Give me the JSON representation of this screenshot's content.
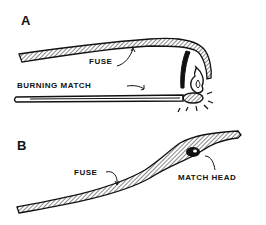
{
  "panels": [
    {
      "letter": "A",
      "labels": {
        "fuse": "FUSE",
        "burning_match": "BURNING MATCH"
      }
    },
    {
      "letter": "B",
      "labels": {
        "fuse": "FUSE",
        "match_head": "MATCH HEAD"
      }
    }
  ],
  "colors": {
    "ink": "#111111",
    "background": "#ffffff"
  }
}
